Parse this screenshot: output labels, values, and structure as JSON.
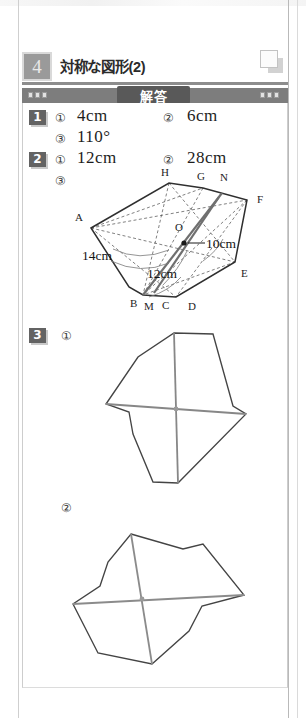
{
  "page": {
    "unit_number": "4",
    "unit_title": "対称な図形(2)",
    "answer_label": "解答",
    "corner_icon": "overlapping-squares-icon",
    "dot_count": 3,
    "colors": {
      "unit_box_fill": "#9a9a9a",
      "unit_rule": "#8d8d8d",
      "answer_bar": "#7d7d7d",
      "answer_tab": "#595959",
      "badge": "#636363",
      "figure_stroke": "#3c3c3c",
      "axis_stroke": "#8a8a8a",
      "page_rule": "#cfcfcf"
    }
  },
  "problems": [
    {
      "number": "1",
      "badge_icon": "problem-badge-1",
      "items": [
        {
          "marker": "①",
          "answer": "4cm"
        },
        {
          "marker": "②",
          "answer": "6cm"
        },
        {
          "marker": "③",
          "answer": "110°"
        }
      ]
    },
    {
      "number": "2",
      "badge_icon": "problem-badge-2",
      "items": [
        {
          "marker": "①",
          "answer": "12cm"
        },
        {
          "marker": "②",
          "answer": "28cm"
        },
        {
          "marker": "③",
          "answer": ""
        }
      ]
    },
    {
      "number": "3",
      "badge_icon": "problem-badge-3",
      "items": [
        {
          "marker": "①",
          "answer": ""
        },
        {
          "marker": "②",
          "answer": ""
        }
      ]
    }
  ],
  "figures": {
    "hexagon": {
      "name": "point-symmetric-hexagon-diagram",
      "vertex_labels": [
        "A",
        "B",
        "C",
        "D",
        "E",
        "F",
        "G",
        "H",
        "N",
        "M",
        "O"
      ],
      "dimension_labels": [
        "10cm",
        "12cm",
        "14cm"
      ],
      "center_label": "O",
      "has_dashed_diagonals": true,
      "has_arc_marks": true
    },
    "shape1": {
      "name": "point-symmetric-figure-1",
      "has_center_point": true,
      "axis_lines": 2
    },
    "shape2": {
      "name": "point-symmetric-figure-2",
      "has_center_point": true,
      "axis_lines": 2
    }
  }
}
